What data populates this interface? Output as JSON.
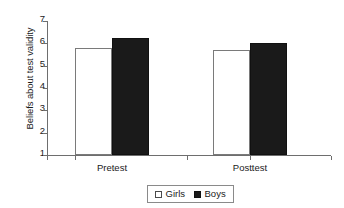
{
  "chart_data": {
    "type": "bar",
    "title": "",
    "xlabel": "",
    "ylabel": "Beliefs about test validity",
    "categories": [
      "Pretest",
      "Posttest"
    ],
    "series": [
      {
        "name": "Girls",
        "values": [
          5.8,
          5.7
        ],
        "color": "#ffffff",
        "swatch": "open-square"
      },
      {
        "name": "Boys",
        "values": [
          6.25,
          6.0
        ],
        "color": "#1a1a1a",
        "swatch": "filled-square"
      }
    ],
    "ylim": [
      1,
      7
    ],
    "yticks": [
      7,
      6,
      5,
      4,
      3,
      2,
      1
    ],
    "ytick_labels": [
      "7",
      "6",
      "5",
      "4",
      "3",
      "2",
      "1"
    ],
    "grid": false,
    "legend": {
      "position": "bottom-center",
      "entries": [
        "Girls",
        "Boys"
      ]
    }
  }
}
